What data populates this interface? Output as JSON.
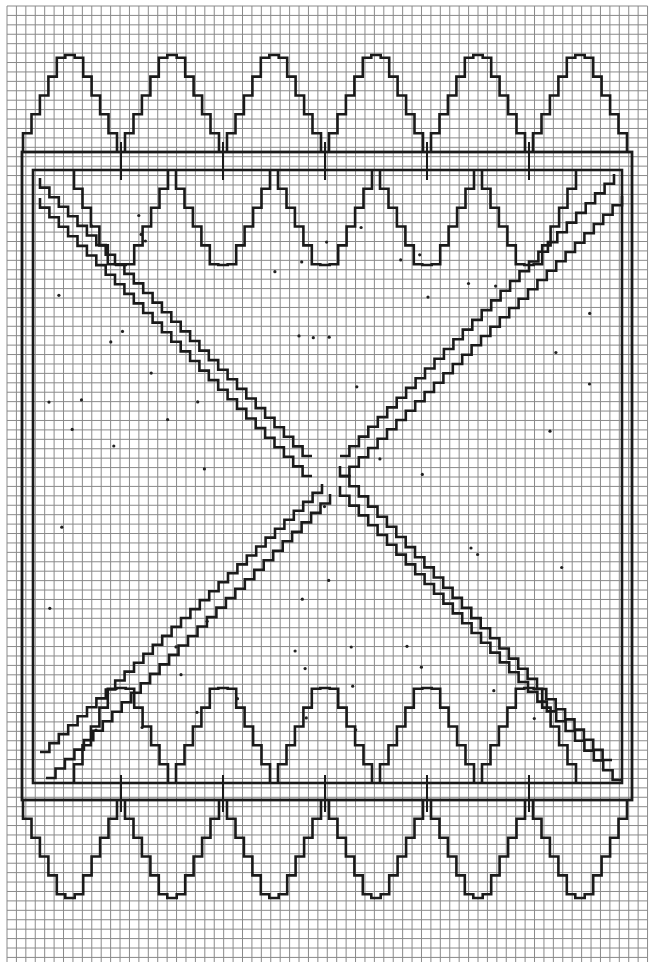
{
  "diagram": {
    "type": "graph-paper weaving pattern",
    "grid": {
      "origin_x": 7,
      "origin_y": 6,
      "cell": 9.42,
      "cols": 68,
      "rows": 102,
      "line_color": "#8a8a8a",
      "major_color": "#9a9a9a"
    },
    "ink_color": "#1a1a1a",
    "outer_frame": {
      "x1": 22,
      "y1": 152,
      "x2": 632,
      "y2": 800
    },
    "inner_frame": {
      "x1": 33,
      "y1": 170,
      "x2": 622,
      "y2": 783
    },
    "top_peaks_cx": [
      70,
      172,
      274,
      376,
      478,
      580
    ],
    "top_peak_y": 55,
    "top_base_y": 152,
    "top_hang_tip_y": 265,
    "bottom_peak_y": 688,
    "bottom_base_y": 783,
    "bottom_hang_tip_y": 898,
    "step": 9.42,
    "center": {
      "x": 326,
      "y": 470
    },
    "dots_color": "#222"
  },
  "caption": ""
}
